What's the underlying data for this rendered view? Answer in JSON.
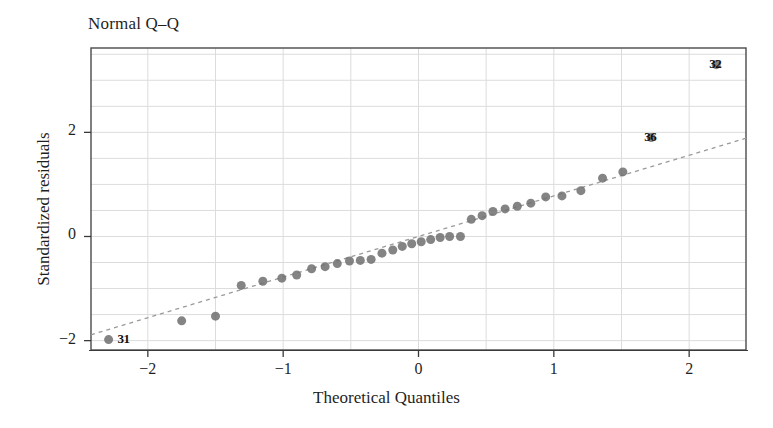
{
  "chart_data": {
    "type": "scatter",
    "title": "Normal Q–Q",
    "xlabel": "Theoretical Quantiles",
    "ylabel": "Standardized residuals",
    "xlim": [
      -2.42,
      2.42
    ],
    "ylim": [
      -2.18,
      3.62
    ],
    "xticks": [
      -2,
      -1,
      0,
      1,
      2
    ],
    "xtick_labels": [
      "−2",
      "−1",
      "0",
      "1",
      "2"
    ],
    "yticks": [
      -2,
      0,
      2
    ],
    "ytick_labels": [
      "−2",
      "0",
      "2"
    ],
    "grid": true,
    "grid_step_x": 0.5,
    "grid_step_y": 0.5,
    "legend": "none",
    "marker_color": "#6f6f6f",
    "marker_size": 9,
    "reference_line": {
      "style": "dashed",
      "color": "#9a9a9a",
      "intercept": 0.0,
      "slope": 0.78
    },
    "x": [
      -2.29,
      -1.75,
      -1.5,
      -1.31,
      -1.15,
      -1.01,
      -0.9,
      -0.79,
      -0.69,
      -0.6,
      -0.51,
      -0.43,
      -0.35,
      -0.27,
      -0.19,
      -0.12,
      -0.05,
      0.02,
      0.09,
      0.16,
      0.23,
      0.31,
      0.39,
      0.47,
      0.55,
      0.64,
      0.73,
      0.83,
      0.94,
      1.06,
      1.2,
      1.36,
      1.51,
      1.72,
      2.2
    ],
    "y": [
      -1.98,
      -1.62,
      -1.53,
      -0.94,
      -0.86,
      -0.8,
      -0.74,
      -0.62,
      -0.58,
      -0.52,
      -0.47,
      -0.46,
      -0.44,
      -0.32,
      -0.26,
      -0.19,
      -0.14,
      -0.1,
      -0.06,
      -0.02,
      0.0,
      0.0,
      0.33,
      0.4,
      0.48,
      0.53,
      0.58,
      0.64,
      0.76,
      0.78,
      0.88,
      1.12,
      1.24,
      1.9,
      3.3
    ],
    "annotations": [
      {
        "label": "31",
        "x": -2.29,
        "y": -1.98,
        "dx": 16,
        "dy": 0
      },
      {
        "label": "36",
        "x": 1.72,
        "y": 1.9,
        "dx": 0,
        "dy": 0
      },
      {
        "label": "32",
        "x": 2.2,
        "y": 3.3,
        "dx": 0,
        "dy": 0
      }
    ]
  },
  "axes": {
    "title": "Normal Q–Q",
    "x_axis_label": "Theoretical Quantiles",
    "y_axis_label": "Standardized residuals"
  }
}
